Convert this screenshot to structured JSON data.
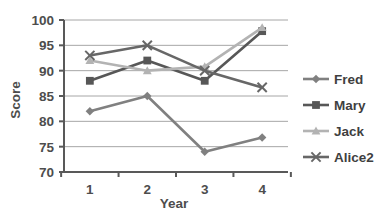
{
  "chart_data": {
    "type": "line",
    "title": "",
    "xlabel": "Year",
    "ylabel": "Score",
    "categories": [
      "1",
      "2",
      "3",
      "4"
    ],
    "x": [
      1,
      2,
      3,
      4
    ],
    "xlim": [
      0.55,
      4.45
    ],
    "ylim": [
      70,
      100
    ],
    "ytick_labels": [
      "70",
      "75",
      "80",
      "85",
      "90",
      "95",
      "100"
    ],
    "yticks": [
      70,
      75,
      80,
      85,
      90,
      95,
      100
    ],
    "grid": true,
    "grid_axis": "y",
    "legend_position": "right",
    "series": [
      {
        "name": "Fred",
        "values": [
          82,
          85,
          74,
          76.8
        ],
        "color": "#808080",
        "marker": "diamond"
      },
      {
        "name": "Mary",
        "values": [
          88,
          92,
          88,
          97.8
        ],
        "color": "#575757",
        "marker": "square"
      },
      {
        "name": "Jack",
        "values": [
          92,
          90,
          90.8,
          98.5
        ],
        "color": "#b3b3b3",
        "marker": "triangle"
      },
      {
        "name": "Alice2",
        "values": [
          93,
          95,
          90,
          86.7
        ],
        "color": "#676767",
        "marker": "x"
      }
    ]
  },
  "legend": {
    "items": [
      {
        "label": "Fred"
      },
      {
        "label": "Mary"
      },
      {
        "label": "Jack"
      },
      {
        "label": "Alice2"
      }
    ]
  },
  "axes": {
    "y_title": "Score",
    "x_title": "Year",
    "y_ticks": [
      "100",
      "95",
      "90",
      "85",
      "80",
      "75",
      "70"
    ],
    "x_ticks": [
      "1",
      "2",
      "3",
      "4"
    ]
  },
  "colors": {
    "axis": "#595959",
    "grid": "#a6a6a6",
    "text": "#4d4d4d",
    "background": "#ffffff"
  }
}
